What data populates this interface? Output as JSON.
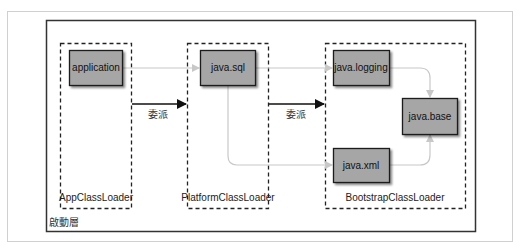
{
  "diagram": {
    "outer_label": "啟動層",
    "loaders": [
      {
        "id": "app",
        "label": "AppClassLoader"
      },
      {
        "id": "platform",
        "label": "PlatformClassLoader"
      },
      {
        "id": "bootstrap",
        "label": "BootstrapClassLoader"
      }
    ],
    "modules": [
      {
        "id": "application",
        "label": "application"
      },
      {
        "id": "java_sql",
        "label": "java.sql"
      },
      {
        "id": "java_logging",
        "label": "java.logging"
      },
      {
        "id": "java_base",
        "label": "java.base"
      },
      {
        "id": "java_xml",
        "label": "java.xml"
      }
    ],
    "delegation_label": "委派",
    "delegations": [
      {
        "from": "app",
        "to": "platform",
        "label": "委派"
      },
      {
        "from": "platform",
        "to": "bootstrap",
        "label": "委派"
      }
    ],
    "dependencies": [
      {
        "from": "application",
        "to": "java.sql"
      },
      {
        "from": "java.sql",
        "to": "java.logging"
      },
      {
        "from": "java.sql",
        "to": "java.xml"
      },
      {
        "from": "java.logging",
        "to": "java.base"
      },
      {
        "from": "java.xml",
        "to": "java.base"
      }
    ],
    "colors": {
      "module_fill": "#a6a6a6",
      "module_border": "#1a1a1a",
      "dependency_line": "#c8c8c8",
      "delegation_arrow": "#111111",
      "frame": "#d0d0d0"
    }
  }
}
